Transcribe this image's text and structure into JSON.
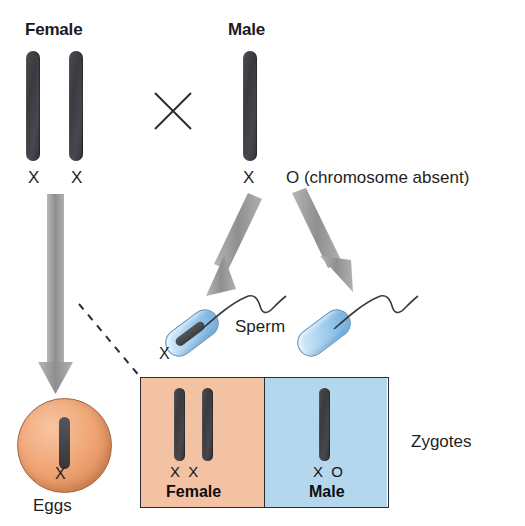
{
  "diagram": {
    "title_female": "Female",
    "title_male": "Male",
    "cross_symbol": "X",
    "female_gamete_labels": [
      "X",
      "X"
    ],
    "male_gamete_labels": [
      "X",
      "O (chromosome absent)"
    ],
    "male_x_label": "X",
    "male_o_label": "O (chromosome absent)",
    "sperm_label": "Sperm",
    "sperm_x_label": "X",
    "eggs_label": "Eggs",
    "egg_x_label": "X",
    "zygotes_label": "Zygotes",
    "zygote_female": {
      "genotype": "X  X",
      "genotype_parts": [
        "X",
        "X"
      ],
      "name": "Female",
      "color": "#f3c2a3"
    },
    "zygote_male": {
      "genotype": "X  O",
      "genotype_parts": [
        "X",
        "O"
      ],
      "name": "Male",
      "color": "#b4d7ee"
    },
    "colors": {
      "chromosome": "#3d3d42",
      "arrow": "#9a9a9a",
      "egg": "#efa878",
      "sperm": "#a8d0ed",
      "zygote_female_bg": "#f3c2a3",
      "zygote_male_bg": "#b4d7ee",
      "outline": "#2b2b33",
      "text": "#1f1f23"
    }
  }
}
